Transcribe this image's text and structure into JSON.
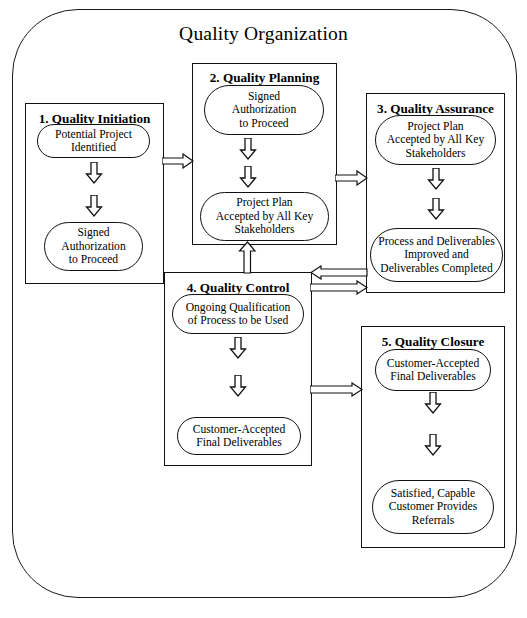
{
  "diagram": {
    "title": "Quality Organization",
    "type": "flowchart",
    "phases": [
      {
        "id": "quality-initiation",
        "title": "1.  Quality Initiation",
        "nodes": [
          {
            "id": "potential-project-identified",
            "label": "Potential Project\nIdentified"
          },
          {
            "id": "signed-authorization-to-proceed-1",
            "label": "Signed\nAuthorization\nto Proceed"
          }
        ]
      },
      {
        "id": "quality-planning",
        "title": "2.  Quality Planning",
        "nodes": [
          {
            "id": "signed-authorization-to-proceed-2",
            "label": "Signed\nAuthorization\nto Proceed"
          },
          {
            "id": "project-plan-accepted-1",
            "label": "Project Plan\nAccepted by All Key\nStakeholders"
          }
        ]
      },
      {
        "id": "quality-assurance",
        "title": "3.  Quality Assurance",
        "nodes": [
          {
            "id": "project-plan-accepted-2",
            "label": "Project Plan\nAccepted by All Key\nStakeholders"
          },
          {
            "id": "process-and-deliverables-improved",
            "label": "Process and Deliverables\nImproved and\nDeliverables Completed"
          }
        ]
      },
      {
        "id": "quality-control",
        "title": "4.  Quality Control",
        "nodes": [
          {
            "id": "ongoing-qualification-of-process",
            "label": "Ongoing Qualification\nof Process to be Used"
          },
          {
            "id": "customer-accepted-final-deliverables-1",
            "label": "Customer-Accepted\nFinal Deliverables"
          }
        ]
      },
      {
        "id": "quality-closure",
        "title": "5.  Quality Closure",
        "nodes": [
          {
            "id": "customer-accepted-final-deliverables-2",
            "label": "Customer-Accepted\nFinal Deliverables"
          },
          {
            "id": "satisfied-capable-customer-provides-referrals",
            "label": "Satisfied, Capable\nCustomer Provides\nReferrals"
          }
        ]
      }
    ],
    "connectors": [
      {
        "id": "initiation-to-planning",
        "direction": "right"
      },
      {
        "id": "planning-to-assurance",
        "direction": "right"
      },
      {
        "id": "assurance-to-control",
        "direction": "left"
      },
      {
        "id": "control-to-assurance",
        "direction": "right"
      },
      {
        "id": "control-to-planning",
        "direction": "up"
      },
      {
        "id": "control-to-closure",
        "direction": "right"
      }
    ],
    "colors": {
      "stroke": "#111111",
      "background": "#ffffff",
      "text": "#000000"
    }
  }
}
